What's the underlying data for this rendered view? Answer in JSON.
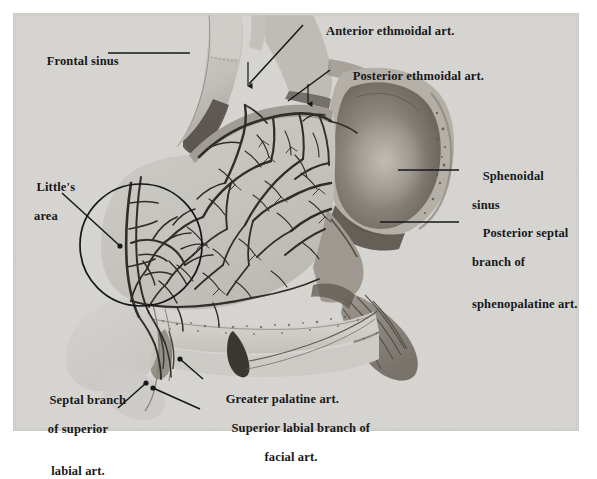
{
  "figure": {
    "kind": "anatomical-photograph-plate",
    "background_color": "#d6d5d1",
    "page_color": "#ffffff",
    "ink_color": "#17181a",
    "plate": {
      "x": 13,
      "y": 13,
      "width": 566,
      "height": 418
    }
  },
  "labels": [
    {
      "id": "frontal-sinus",
      "name": "frontal-sinus",
      "lines": [
        "Frontal sinus"
      ],
      "text_x": 27,
      "text_y": 46,
      "leader": {
        "type": "line",
        "points": [
          [
            108,
            53
          ],
          [
            190,
            53
          ]
        ],
        "terminal": "none"
      }
    },
    {
      "id": "anterior-ethmoidal-art",
      "name": "anterior-ethmoidal-artery",
      "lines": [
        "Anterior ethmoidal art."
      ],
      "text_x": 307,
      "text_y": 15,
      "leader": {
        "type": "line",
        "points": [
          [
            303,
            25
          ],
          [
            247,
            86
          ]
        ],
        "terminal": "arrow-down",
        "arrow": [
          [
            248,
            62
          ],
          [
            248,
            90
          ]
        ]
      }
    },
    {
      "id": "posterior-ethmoidal-art",
      "name": "posterior-ethmoidal-artery",
      "lines": [
        "Posterior ethmoidal art."
      ],
      "text_x": 333,
      "text_y": 60,
      "leader": {
        "type": "line",
        "points": [
          [
            330,
            70
          ],
          [
            286,
            103
          ]
        ],
        "terminal": "arrow-down",
        "arrow": [
          [
            308,
            83
          ],
          [
            308,
            106
          ]
        ]
      }
    },
    {
      "id": "sphenoidal-sinus",
      "name": "sphenoidal-sinus",
      "lines": [
        "Sphenoidal",
        "sinus"
      ],
      "text_x": 463,
      "text_y": 160,
      "leader": {
        "type": "line",
        "points": [
          [
            398,
            170
          ],
          [
            459,
            170
          ]
        ],
        "terminal": "none"
      }
    },
    {
      "id": "posterior-septal-branch",
      "name": "posterior-septal-branch-of-sphenopalatine-artery",
      "lines": [
        "Posterior septal",
        "branch of",
        "sphenopalatine art."
      ],
      "text_x": 463,
      "text_y": 217,
      "bold_tail": "art.",
      "leader": {
        "type": "line",
        "points": [
          [
            380,
            222
          ],
          [
            459,
            222
          ]
        ],
        "terminal": "none"
      }
    },
    {
      "id": "littles-area",
      "name": "littles-area",
      "lines": [
        "Little's",
        "area"
      ],
      "text_x": 14,
      "text_y": 170,
      "align": "center",
      "leader": {
        "type": "line",
        "points": [
          [
            62,
            193
          ],
          [
            121,
            247
          ]
        ],
        "terminal": "dot"
      }
    },
    {
      "id": "septal-branch-superior-labial",
      "name": "septal-branch-of-superior-labial-artery",
      "lines": [
        "Septal branch",
        "of superior",
        "labial art."
      ],
      "text_x": 34,
      "text_y": 383,
      "align": "center",
      "leader": {
        "type": "line",
        "points": [
          [
            118,
            408
          ],
          [
            147,
            382
          ]
        ],
        "terminal": "dot"
      }
    },
    {
      "id": "greater-palatine-art",
      "name": "greater-palatine-artery",
      "lines": [
        "Greater palatine art."
      ],
      "text_x": 204,
      "text_y": 383,
      "leader": {
        "type": "line",
        "points": [
          [
            203,
            380
          ],
          [
            179,
            358
          ]
        ],
        "terminal": "dot"
      }
    },
    {
      "id": "superior-labial-branch-facial",
      "name": "superior-labial-branch-of-facial-artery",
      "lines": [
        "Superior labial branch of",
        "facial art."
      ],
      "text_x": 204,
      "text_y": 412,
      "align": "center",
      "leader": {
        "type": "line",
        "points": [
          [
            201,
            412
          ],
          [
            152,
            389
          ]
        ],
        "terminal": "dot"
      }
    }
  ],
  "annotations": {
    "littles_area_circle": {
      "cx": 141,
      "cy": 245,
      "r": 61,
      "stroke": "#16171a",
      "stroke_width": 1.6
    }
  },
  "anatomy_regions": [
    {
      "name": "frontal-sinus-cavity",
      "tone": "light"
    },
    {
      "name": "nasal-septum-mucosa",
      "tone": "mid"
    },
    {
      "name": "sphenoidal-sinus-cavity",
      "tone": "dark"
    },
    {
      "name": "hard-palate",
      "tone": "light"
    },
    {
      "name": "nasal-tip-columella",
      "tone": "light"
    },
    {
      "name": "arterial-network",
      "tone": "dark-lines"
    }
  ]
}
